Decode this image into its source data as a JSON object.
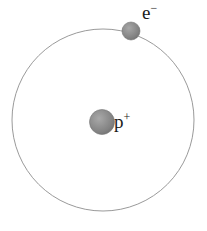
{
  "figure": {
    "background_color": "#ffffff",
    "width": 207,
    "height": 231
  },
  "orbit": {
    "name": "electron-orbit",
    "center_x": 103,
    "center_y": 120,
    "radius": 91,
    "stroke_color": "#9a9a9a",
    "stroke_width": 1,
    "fill": "none"
  },
  "nucleus": {
    "label_text": "p",
    "charge": "+",
    "center_x": 102,
    "center_y": 122,
    "radius": 12.5,
    "color": "#8a8a8a",
    "highlight_color": "#a8a8a8",
    "shadow_color": "#6e6e6e"
  },
  "electron": {
    "label_text": "e",
    "charge": "−",
    "center_x": 131,
    "center_y": 31,
    "radius": 9,
    "color": "#8a8a8a",
    "highlight_color": "#a8a8a8",
    "shadow_color": "#6e6e6e"
  }
}
